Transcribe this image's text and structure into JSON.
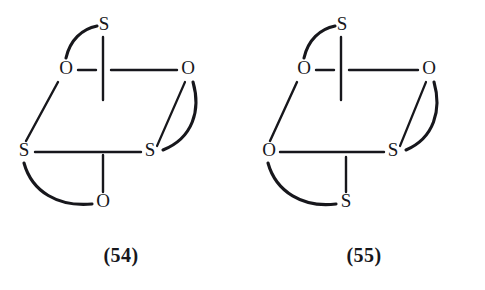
{
  "figure": {
    "background_color": "#ffffff",
    "ink_color": "#17171c",
    "structure_count": 2
  },
  "structures": [
    {
      "id": "54",
      "caption": "(54)",
      "atoms": {
        "top": "S",
        "upper_left": "O",
        "upper_right": "O",
        "lower_left": "S",
        "lower_right": "S",
        "bottom": "O"
      },
      "atom_list": [
        "S",
        "O",
        "O",
        "S",
        "S",
        "O"
      ],
      "bonds": [
        {
          "from": "upper_left",
          "to": "top",
          "style": "arc"
        },
        {
          "from": "top",
          "to": "center",
          "style": "straight"
        },
        {
          "from": "upper_left",
          "to": "upper_right",
          "style": "straight-broken"
        },
        {
          "from": "upper_left",
          "to": "lower_left",
          "style": "straight"
        },
        {
          "from": "upper_right",
          "to": "lower_right",
          "style": "straight"
        },
        {
          "from": "upper_right",
          "to": "lower_right",
          "style": "arc"
        },
        {
          "from": "lower_left",
          "to": "lower_right",
          "style": "straight"
        },
        {
          "from": "lower_right",
          "to": "bottom",
          "style": "straight"
        },
        {
          "from": "lower_left",
          "to": "bottom",
          "style": "arc"
        }
      ]
    },
    {
      "id": "55",
      "caption": "(55)",
      "atoms": {
        "top": "S",
        "upper_left": "O",
        "upper_right": "O",
        "lower_left": "O",
        "lower_right": "S",
        "bottom": "S"
      },
      "atom_list": [
        "S",
        "O",
        "O",
        "O",
        "S",
        "S"
      ],
      "bonds": [
        {
          "from": "upper_left",
          "to": "top",
          "style": "arc"
        },
        {
          "from": "top",
          "to": "center",
          "style": "straight"
        },
        {
          "from": "upper_left",
          "to": "upper_right",
          "style": "straight-broken"
        },
        {
          "from": "upper_left",
          "to": "lower_left",
          "style": "straight"
        },
        {
          "from": "upper_right",
          "to": "lower_right",
          "style": "straight"
        },
        {
          "from": "upper_right",
          "to": "lower_right",
          "style": "arc"
        },
        {
          "from": "lower_left",
          "to": "lower_right",
          "style": "straight"
        },
        {
          "from": "lower_right",
          "to": "bottom",
          "style": "straight"
        },
        {
          "from": "lower_left",
          "to": "bottom",
          "style": "arc"
        }
      ]
    }
  ]
}
